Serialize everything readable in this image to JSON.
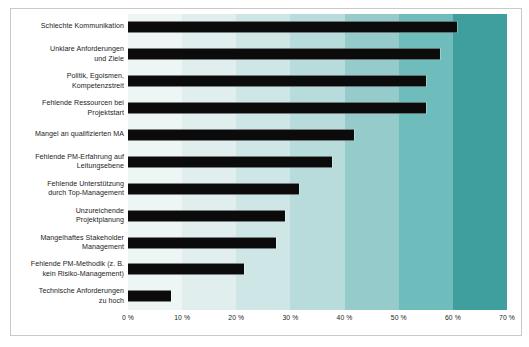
{
  "chart_data": {
    "type": "bar",
    "orientation": "horizontal",
    "title": "",
    "xlabel": "",
    "ylabel": "",
    "xlim": [
      0,
      70
    ],
    "grid": false,
    "legend": null,
    "tick_suffix": " %",
    "xticks": [
      "0 %",
      "10 %",
      "20 %",
      "30 %",
      "40 %",
      "50 %",
      "60 %",
      "70 %"
    ],
    "xtick_values": [
      0,
      10,
      20,
      30,
      40,
      50,
      60,
      70
    ],
    "categories": [
      "Schlechte Kommunikation",
      "Unklare Anforderungen\nund Ziele",
      "Politik, Egoismen,\nKompetenzstreit",
      "Fehlende Ressourcen bei\nProjektstart",
      "Mangel an qualifizierten MA",
      "Fehlende PM-Erfahrung auf\nLeitungsebene",
      "Fehlende Unterstützung\ndurch Top-Management",
      "Unzureichende\nProjektplanung",
      "Mangelhaftes Stakeholder\nManagement",
      "Fehlende PM-Methodik (z. B.\nkein Risiko-Management)",
      "Technische Anforderungen\nzu hoch"
    ],
    "values": [
      60.7,
      57.6,
      55.0,
      55.0,
      41.7,
      37.6,
      31.5,
      29.0,
      27.4,
      21.5,
      8.0
    ],
    "bar_color": "#0b0b0b",
    "background_bands": [
      "#eef5f5",
      "#e0eeee",
      "#cfe6e6",
      "#b8dcdc",
      "#96cbcb",
      "#6fbcbc",
      "#3f9f9f"
    ],
    "frame_color": "#c9c9c9"
  }
}
